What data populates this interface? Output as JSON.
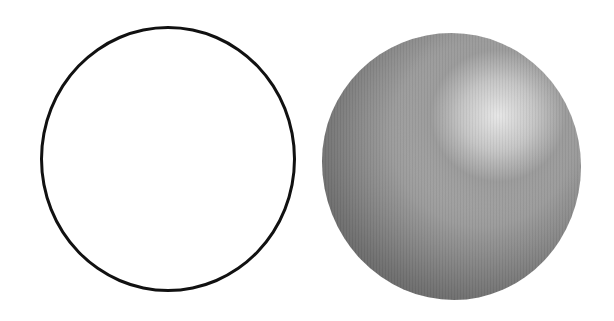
{
  "figure": {
    "items": [
      {
        "name": "outline-circle",
        "stroke_color": "#111111",
        "fill_color": "#ffffff"
      },
      {
        "name": "shaded-sphere",
        "highlight_color": "#e6e6e6",
        "midtone_color": "#9a9a9a",
        "shadow_color": "#555555",
        "light_source": "upper-right"
      }
    ]
  }
}
